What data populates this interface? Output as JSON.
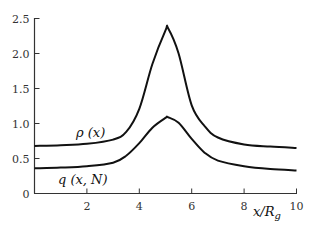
{
  "chart_data": {
    "type": "line",
    "title": "",
    "xlabel": "x/R_g",
    "ylabel": "",
    "xlim": [
      0,
      10
    ],
    "ylim": [
      0,
      2.5
    ],
    "grid": false,
    "legend": "none (inline curve labels)",
    "x_ticks": [
      2,
      4,
      6,
      8,
      10
    ],
    "x_tick_labels": [
      "2",
      "4",
      "6",
      "8",
      "10"
    ],
    "y_ticks": [
      0,
      0.5,
      1.0,
      1.5,
      2.0,
      2.5
    ],
    "y_tick_labels": [
      "0",
      "0.5",
      "1.0",
      "1.5",
      "2.0",
      "2.5"
    ],
    "x": [
      0,
      1,
      2,
      3,
      3.5,
      4,
      4.5,
      5,
      5.1,
      5.5,
      6,
      6.5,
      7,
      8,
      9,
      10
    ],
    "series": [
      {
        "name": "ρ (x)",
        "values": [
          0.68,
          0.69,
          0.71,
          0.77,
          0.88,
          1.21,
          1.85,
          2.33,
          2.36,
          2.0,
          1.26,
          0.96,
          0.8,
          0.7,
          0.67,
          0.65
        ]
      },
      {
        "name": "q (x, N)",
        "values": [
          0.36,
          0.37,
          0.39,
          0.44,
          0.54,
          0.72,
          0.94,
          1.08,
          1.09,
          1.01,
          0.78,
          0.58,
          0.47,
          0.39,
          0.35,
          0.33
        ]
      }
    ],
    "annotations": [
      {
        "text": "ρ (x)",
        "x": 1.6,
        "y": 0.82
      },
      {
        "text": "q (x, N)",
        "x": 1.0,
        "y": 0.18
      }
    ]
  },
  "labels": {
    "rho": "ρ (x)",
    "q": "q (x, N)",
    "xaxis": "x/R",
    "xaxis_sub": "g"
  },
  "style": {
    "line_color": "#111111",
    "axis_color": "#333333"
  }
}
